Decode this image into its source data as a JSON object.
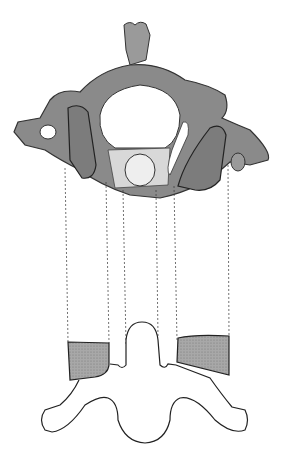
{
  "figure": {
    "colors": {
      "bone": "#8a8a8a",
      "bone_dark": "#4a4a4a",
      "facet_fill": "#9a9a9a",
      "outline": "#222222",
      "background": "#ffffff"
    },
    "projection_lines_x": [
      65,
      106,
      123,
      156,
      174,
      228
    ]
  }
}
